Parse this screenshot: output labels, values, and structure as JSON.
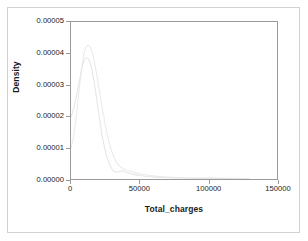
{
  "chart_data": {
    "type": "line",
    "title": "",
    "xlabel": "Total_charges",
    "ylabel": "Density",
    "xlim": [
      0,
      150000
    ],
    "ylim": [
      0,
      5e-05
    ],
    "grid": false,
    "legend": "none",
    "xticks": [
      0,
      50000,
      100000,
      150000
    ],
    "xtick_labels": [
      "0",
      "50000",
      "100000",
      "150000"
    ],
    "yticks": [
      0.0,
      1e-05,
      2e-05,
      3e-05,
      4e-05,
      5e-05
    ],
    "ytick_labels": [
      "0.00000",
      "0.00001",
      "0.00002",
      "0.00003",
      "0.00004",
      "0.00005"
    ],
    "series": [
      {
        "name": "density-curve-1",
        "color": "#ebebeb",
        "x": [
          0,
          2000,
          4000,
          6000,
          8000,
          10000,
          12000,
          14000,
          16000,
          18000,
          20000,
          23000,
          26000,
          29000,
          32000,
          35000,
          38000,
          42000,
          46000,
          50000,
          55000,
          60000,
          65000,
          70000,
          80000,
          90000,
          100000,
          110000,
          120000,
          130000
        ],
        "y": [
          9.8e-06,
          1.4e-05,
          2.05e-05,
          2.85e-05,
          3.6e-05,
          4.1e-05,
          4.25e-05,
          4.2e-05,
          3.95e-05,
          3.5e-05,
          3e-05,
          2.2e-05,
          1.5e-05,
          9.8e-06,
          6.2e-06,
          4.2e-06,
          3.3e-06,
          2.6e-06,
          2.1e-06,
          1.7e-06,
          1.3e-06,
          1e-06,
          8e-07,
          6e-07,
          4e-07,
          3e-07,
          3e-07,
          2e-07,
          2e-07,
          1e-07
        ]
      },
      {
        "name": "density-curve-2",
        "color": "#e6e6e6",
        "x": [
          0,
          2000,
          4000,
          6000,
          8000,
          10000,
          12000,
          14000,
          16000,
          18000,
          20000,
          23000,
          26000,
          29000,
          31000,
          33000,
          35000,
          37000,
          39000,
          42000,
          46000,
          50000,
          55000,
          60000,
          65000,
          70000,
          80000,
          90000,
          100000,
          110000,
          120000,
          130000
        ],
        "y": [
          1.98e-05,
          2.25e-05,
          2.65e-05,
          3.1e-05,
          3.55e-05,
          3.82e-05,
          3.85e-05,
          3.7e-05,
          3.3e-05,
          2.75e-05,
          2.15e-05,
          1.3e-05,
          7.2e-06,
          3.8e-06,
          2.6e-06,
          2.2e-06,
          2.4e-06,
          2.6e-06,
          2.4e-06,
          1.9e-06,
          1.4e-06,
          1.1e-06,
          8e-07,
          6e-07,
          5e-07,
          4e-07,
          3e-07,
          2e-07,
          2e-07,
          2e-07,
          1e-07,
          1e-07
        ]
      }
    ]
  },
  "colors": {
    "outer_border": "#d2d2d2",
    "axis": "#9a9a9a",
    "text": "#1a1a1a",
    "background": "#ffffff"
  }
}
